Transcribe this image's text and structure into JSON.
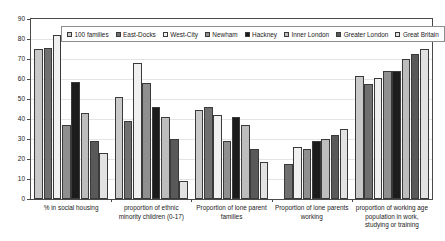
{
  "chart_data": {
    "type": "bar",
    "title": "",
    "xlabel": "",
    "ylabel": "",
    "ylim": [
      0,
      90
    ],
    "yticks": [
      0,
      10,
      20,
      30,
      40,
      50,
      60,
      70,
      80,
      90
    ],
    "grid": true,
    "legend_position": "top",
    "categories": [
      "% in social housing",
      "proportion of ethnic minority children (0-17)",
      "Proportion of lone parent families",
      "Proportion of lone parents working",
      "proportion of working age population in work, studying or training"
    ],
    "series": [
      {
        "name": "100 families",
        "color": "#c9c9c9",
        "values": [
          75.2,
          51.0,
          44.5,
          0,
          61.5
        ]
      },
      {
        "name": "East-Docks",
        "color": "#707070",
        "values": [
          75.4,
          39.0,
          46.0,
          17.7,
          57.5
        ]
      },
      {
        "name": "West-City",
        "color": "#f0f0f0",
        "values": [
          82.0,
          68.0,
          42.0,
          26.0,
          60.5
        ]
      },
      {
        "name": "Newham",
        "color": "#8f8f8f",
        "values": [
          37.2,
          57.8,
          29.0,
          25.0,
          64.0
        ]
      },
      {
        "name": "Hackney",
        "color": "#1c1c1c",
        "values": [
          58.6,
          46.0,
          40.8,
          29.0,
          64.0
        ]
      },
      {
        "name": "Inner London",
        "color": "#bdbdbd",
        "values": [
          43.0,
          41.0,
          37.0,
          30.0,
          70.0
        ]
      },
      {
        "name": "Greater London",
        "color": "#595959",
        "values": [
          29.2,
          30.0,
          25.0,
          32.0,
          72.3
        ]
      },
      {
        "name": "Great Britain",
        "color": "#e2e2e2",
        "values": [
          22.8,
          8.8,
          18.5,
          35.2,
          75.0
        ]
      }
    ]
  },
  "legend": {
    "items": [
      "100 families",
      "East-Docks",
      "West-City",
      "Newham",
      "Hackney",
      "Inner London",
      "Greater London",
      "Great Britain"
    ]
  },
  "y_axis": {
    "labels": [
      "90",
      "80",
      "70",
      "60",
      "50",
      "40",
      "30",
      "20",
      "10",
      "0"
    ]
  },
  "x_axis": {
    "labels": [
      "% in social housing",
      "proportion of ethnic minority children (0-17)",
      "Proportion of lone parent families",
      "Proportion of lone parents working",
      "proportion of working age population in work, studying or training"
    ]
  }
}
